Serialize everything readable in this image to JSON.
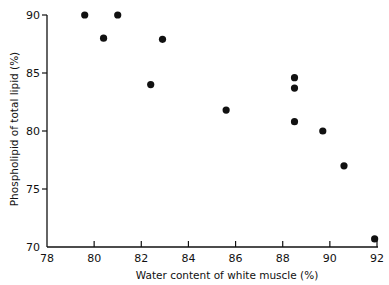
{
  "chart_data": {
    "type": "scatter",
    "title": "",
    "xlabel": "Water content of white muscle (%)",
    "ylabel": "Phospholipid of total lipid (%)",
    "xlim": [
      78,
      92
    ],
    "ylim": [
      70,
      90
    ],
    "xticks": [
      "78",
      "80",
      "82",
      "84",
      "86",
      "88",
      "90",
      "92"
    ],
    "yticks": [
      "70",
      "75",
      "80",
      "85",
      "90"
    ],
    "grid": false,
    "legend": null,
    "marker_color": "#111111",
    "points": [
      {
        "x": 79.6,
        "y": 90.0
      },
      {
        "x": 81.0,
        "y": 90.0
      },
      {
        "x": 80.4,
        "y": 88.0
      },
      {
        "x": 82.9,
        "y": 87.9
      },
      {
        "x": 82.4,
        "y": 84.0
      },
      {
        "x": 85.6,
        "y": 81.8
      },
      {
        "x": 88.5,
        "y": 84.6
      },
      {
        "x": 88.5,
        "y": 83.7
      },
      {
        "x": 88.5,
        "y": 80.8
      },
      {
        "x": 89.7,
        "y": 80.0
      },
      {
        "x": 90.6,
        "y": 77.0
      },
      {
        "x": 91.9,
        "y": 70.7
      }
    ]
  }
}
